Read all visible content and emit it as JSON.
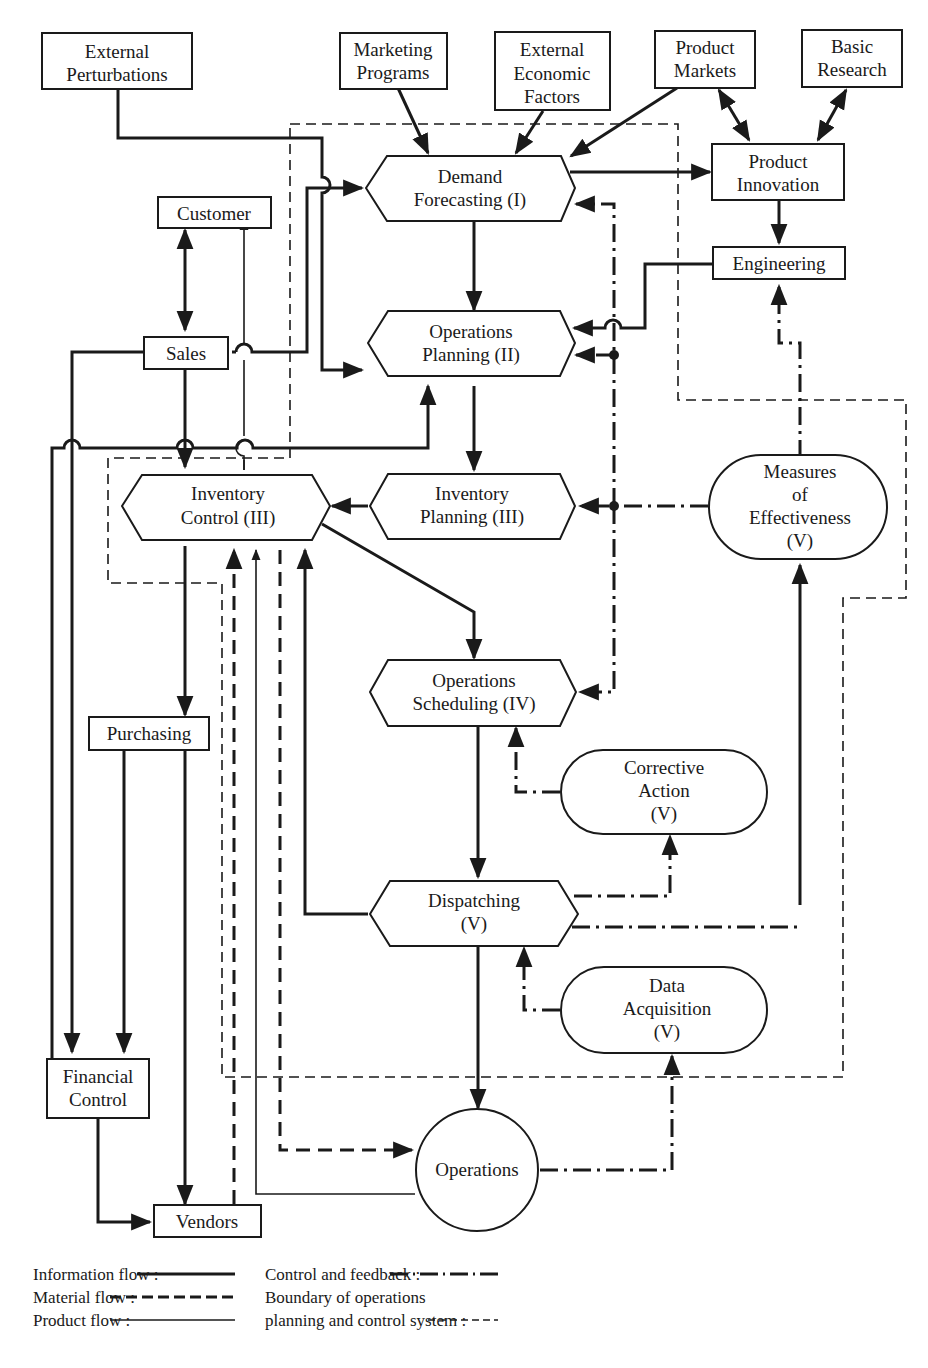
{
  "nodes": {
    "external_perturbations": [
      "External",
      "Perturbations"
    ],
    "marketing_programs": [
      "Marketing",
      "Programs"
    ],
    "external_economic_factors": [
      "External",
      "Economic",
      "Factors"
    ],
    "product_markets": [
      "Product",
      "Markets"
    ],
    "basic_research": [
      "Basic",
      "Research"
    ],
    "demand_forecasting": [
      "Demand",
      "Forecasting (I)"
    ],
    "product_innovation": [
      "Product",
      "Innovation"
    ],
    "customer": [
      "Customer"
    ],
    "engineering": [
      "Engineering"
    ],
    "sales": [
      "Sales"
    ],
    "operations_planning": [
      "Operations",
      "Planning (II)"
    ],
    "inventory_control": [
      "Inventory",
      "Control (III)"
    ],
    "inventory_planning": [
      "Inventory",
      "Planning (III)"
    ],
    "measures_of_effectiveness": [
      "Measures",
      "of",
      "Effectiveness",
      "(V)"
    ],
    "operations_scheduling": [
      "Operations",
      "Scheduling (IV)"
    ],
    "purchasing": [
      "Purchasing"
    ],
    "corrective_action": [
      "Corrective",
      "Action",
      "(V)"
    ],
    "dispatching": [
      "Dispatching",
      "(V)"
    ],
    "data_acquisition": [
      "Data",
      "Acquisition",
      "(V)"
    ],
    "financial_control": [
      "Financial",
      "Control"
    ],
    "operations": [
      "Operations"
    ],
    "vendors": [
      "Vendors"
    ]
  },
  "legend": {
    "information_flow": "Information flow :",
    "material_flow": "Material flow :",
    "product_flow": "Product flow :",
    "control_feedback": "Control and feedback :",
    "boundary_line1": "Boundary of operations",
    "boundary_line2": "planning and control system :"
  }
}
